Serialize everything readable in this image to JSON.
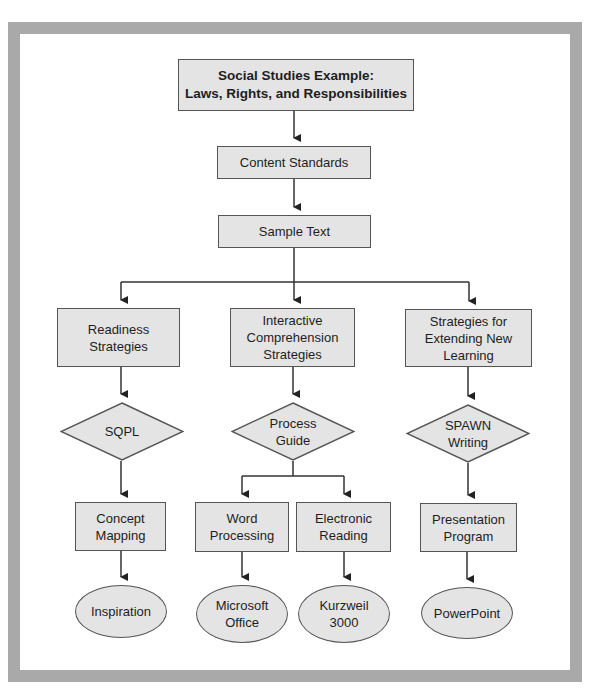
{
  "diagram": {
    "type": "flowchart",
    "colors": {
      "frame": "#a9a9a9",
      "node_fill": "#e4e4e4",
      "node_border": "#555555",
      "line": "#333333",
      "text": "#1e1e1e"
    },
    "title": {
      "line1": "Social Studies Example:",
      "line2": "Laws, Rights, and Responsibilities"
    },
    "content_standards": {
      "label": "Content Standards"
    },
    "sample_text": {
      "label": "Sample Text"
    },
    "branches": [
      {
        "strategy": {
          "line1": "Readiness",
          "line2": "Strategies"
        },
        "method": {
          "line1": "SQPL"
        },
        "tools": [
          {
            "box": {
              "line1": "Concept",
              "line2": "Mapping"
            },
            "software": {
              "line1": "Inspiration"
            }
          }
        ]
      },
      {
        "strategy": {
          "line1": "Interactive",
          "line2": "Comprehension",
          "line3": "Strategies"
        },
        "method": {
          "line1": "Process",
          "line2": "Guide"
        },
        "tools": [
          {
            "box": {
              "line1": "Word",
              "line2": "Processing"
            },
            "software": {
              "line1": "Microsoft",
              "line2": "Office"
            }
          },
          {
            "box": {
              "line1": "Electronic",
              "line2": "Reading"
            },
            "software": {
              "line1": "Kurzweil",
              "line2": "3000"
            }
          }
        ]
      },
      {
        "strategy": {
          "line1": "Strategies for",
          "line2": "Extending New",
          "line3": "Learning"
        },
        "method": {
          "line1": "SPAWN",
          "line2": "Writing"
        },
        "tools": [
          {
            "box": {
              "line1": "Presentation",
              "line2": "Program"
            },
            "software": {
              "line1": "PowerPoint"
            }
          }
        ]
      }
    ]
  }
}
